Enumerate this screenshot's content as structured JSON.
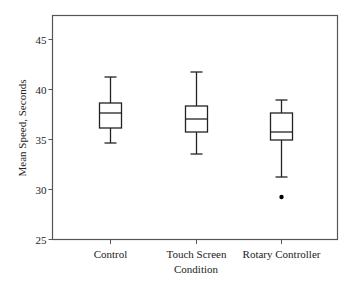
{
  "chart_data": {
    "type": "box",
    "title": "",
    "xlabel": "Condition",
    "ylabel": "Mean Speed, Seconds",
    "ylim": [
      25,
      46.5
    ],
    "yticks": [
      25,
      30,
      35,
      40,
      45
    ],
    "grid": false,
    "legend": null,
    "categories": [
      "Control",
      "Touch Screen",
      "Rotary Controller"
    ],
    "series": [
      {
        "name": "Control",
        "whisker_low": 34.6,
        "q1": 36.1,
        "median": 37.6,
        "q3": 38.6,
        "whisker_high": 41.2,
        "outliers": []
      },
      {
        "name": "Touch Screen",
        "whisker_low": 33.5,
        "q1": 35.7,
        "median": 37.0,
        "q3": 38.3,
        "whisker_high": 41.7,
        "outliers": []
      },
      {
        "name": "Rotary Controller",
        "whisker_low": 31.2,
        "q1": 34.9,
        "median": 35.7,
        "q3": 37.6,
        "whisker_high": 38.9,
        "outliers": [
          29.2
        ]
      }
    ]
  },
  "colors": {
    "axis": "#555555",
    "box": "#222222",
    "outlier": "#000000"
  }
}
